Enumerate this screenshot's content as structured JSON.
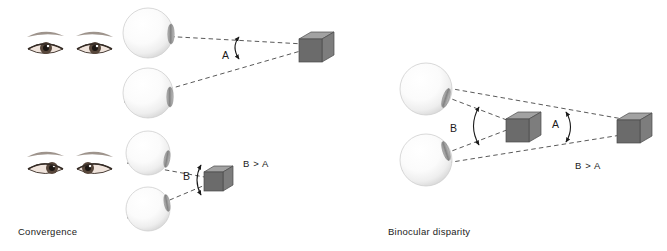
{
  "figure": {
    "background_color": "#ffffff",
    "width": 667,
    "height": 251
  },
  "panels": [
    {
      "id": "convergence",
      "caption": "Convergence",
      "relation_text": "B > A",
      "description": "Two pairs of eyeballs viewing a cube at far and near distance; the convergence angle is larger for the nearer object.",
      "angle_labels": [
        "A",
        "B"
      ],
      "angles": [
        {
          "label": "A",
          "meaning": "convergence angle for distant cube",
          "vertex_x": 312,
          "vertex_y": 47,
          "approx_degrees": 13
        },
        {
          "label": "B",
          "meaning": "convergence angle for near cube",
          "vertex_x": 213,
          "vertex_y": 180,
          "approx_degrees": 36
        }
      ],
      "eye_photos": [
        {
          "name": "eyes-parallel-gaze",
          "state": "eyes looking straight ahead"
        },
        {
          "name": "eyes-converged-gaze",
          "state": "eyes converged inward"
        }
      ],
      "eyeballs": [
        {
          "name": "eyeball-top-far",
          "cx": 148,
          "cy": 33,
          "r": 25
        },
        {
          "name": "eyeball-bottom-far",
          "cx": 148,
          "cy": 93,
          "r": 25
        },
        {
          "name": "eyeball-top-near",
          "cx": 148,
          "cy": 153,
          "r": 22
        },
        {
          "name": "eyeball-bottom-near",
          "cx": 148,
          "cy": 209,
          "r": 22
        }
      ],
      "cubes": [
        {
          "name": "cube-far",
          "x": 299,
          "y": 32,
          "size": 23
        },
        {
          "name": "cube-near",
          "x": 204,
          "y": 166,
          "size": 19
        }
      ]
    },
    {
      "id": "binocular-disparity",
      "caption": "Binocular disparity",
      "relation_text": "B > A",
      "description": "Two eyeballs fixating a near cube and a far cube; the angular disparity is larger for the nearer cube.",
      "angle_labels": [
        "B",
        "A"
      ],
      "angles": [
        {
          "label": "B",
          "meaning": "disparity angle at near cube",
          "vertex_x": 508,
          "vertex_y": 125,
          "approx_degrees": 40
        },
        {
          "label": "A",
          "meaning": "disparity angle at far cube",
          "vertex_x": 637,
          "vertex_y": 127,
          "approx_degrees": 16
        }
      ],
      "eyeballs": [
        {
          "name": "eyeball-upper",
          "cx": 426,
          "cy": 89,
          "r": 26
        },
        {
          "name": "eyeball-lower",
          "cx": 426,
          "cy": 160,
          "r": 26
        }
      ],
      "cubes": [
        {
          "name": "cube-near",
          "x": 506,
          "y": 112,
          "size": 23
        },
        {
          "name": "cube-far",
          "x": 617,
          "y": 113,
          "size": 23
        }
      ]
    }
  ],
  "style_tokens": {
    "line_color": "#555555",
    "cube_front_color": "#6e6e6e",
    "cube_top_color": "#9c9c9c",
    "cube_side_color": "#828282",
    "cube_stroke_color": "#3c3c3c",
    "eyeball_fill_light": "#ffffff",
    "eyeball_fill_shade": "#e2e2e2",
    "eyeball_edge_color": "#c8c8c8",
    "lens_color": "#8e8e8e",
    "text_color": "#1a1a1a",
    "caption_color": "#222222"
  }
}
